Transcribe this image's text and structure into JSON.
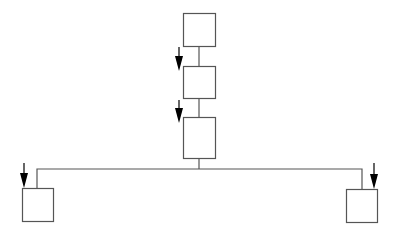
{
  "diagram": {
    "type": "tree",
    "colors": {
      "stroke": "#555555",
      "arrow": "#000000",
      "fill": "#ffffff"
    },
    "nodes": [
      {
        "id": "box-1",
        "x": 183,
        "y": 13,
        "w": 32,
        "h": 33
      },
      {
        "id": "box-2",
        "x": 183,
        "y": 66,
        "w": 32,
        "h": 32
      },
      {
        "id": "box-3",
        "x": 183,
        "y": 117,
        "w": 32,
        "h": 41
      },
      {
        "id": "box-left",
        "x": 22,
        "y": 188,
        "w": 31,
        "h": 33
      },
      {
        "id": "box-right",
        "x": 346,
        "y": 189,
        "w": 31,
        "h": 33
      }
    ],
    "connectors": [
      {
        "id": "box1-box2",
        "points": "199,46 199,66"
      },
      {
        "id": "box2-box3",
        "points": "199,98 199,117"
      },
      {
        "id": "box3-bus",
        "points": "199,158 199,169"
      },
      {
        "id": "bus",
        "points": "37,188 37,169 362,169 362,189"
      }
    ],
    "arrows": [
      {
        "id": "arrow-to-box-2",
        "x": 179,
        "y1": 47,
        "y2": 71
      },
      {
        "id": "arrow-to-box-3",
        "x": 179,
        "y1": 100,
        "y2": 123
      },
      {
        "id": "arrow-to-box-left",
        "x": 24,
        "y1": 163,
        "y2": 188
      },
      {
        "id": "arrow-to-box-right",
        "x": 374,
        "y1": 163,
        "y2": 189
      }
    ]
  }
}
